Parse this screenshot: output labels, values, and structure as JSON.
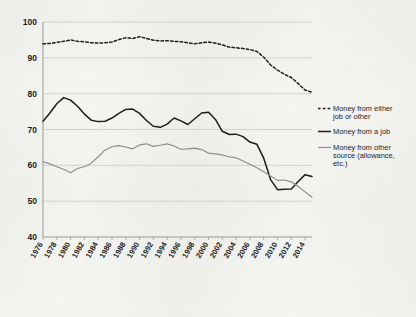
{
  "chart_data": {
    "type": "line",
    "title": "",
    "subtitle": "",
    "xlabel": "",
    "ylabel": "",
    "xlim": [
      1976,
      2015
    ],
    "ylim": [
      40,
      100
    ],
    "yticks": [
      40,
      50,
      60,
      70,
      80,
      90,
      100
    ],
    "xticks": [
      1976,
      1978,
      1980,
      1982,
      1984,
      1986,
      1988,
      1990,
      1992,
      1994,
      1996,
      1998,
      2000,
      2002,
      2004,
      2006,
      2008,
      2010,
      2012,
      2014
    ],
    "grid": true,
    "legend_position": "right",
    "x": [
      1976,
      1977,
      1978,
      1979,
      1980,
      1981,
      1982,
      1983,
      1984,
      1985,
      1986,
      1987,
      1988,
      1989,
      1990,
      1991,
      1992,
      1993,
      1994,
      1995,
      1996,
      1997,
      1998,
      1999,
      2000,
      2001,
      2002,
      2003,
      2004,
      2005,
      2006,
      2007,
      2008,
      2009,
      2010,
      2011,
      2012,
      2013,
      2014,
      2015
    ],
    "series": [
      {
        "name": "Money from either job or other",
        "style": "dashed",
        "color": "#1a1a1a",
        "values": [
          93.9,
          94.0,
          94.3,
          94.6,
          95.0,
          94.6,
          94.5,
          94.2,
          94.1,
          94.2,
          94.4,
          95.1,
          95.6,
          95.4,
          95.9,
          95.4,
          94.9,
          94.7,
          94.8,
          94.6,
          94.5,
          94.2,
          93.9,
          94.2,
          94.4,
          94.1,
          93.6,
          93.0,
          92.8,
          92.6,
          92.3,
          91.8,
          90.2,
          88.0,
          86.6,
          85.4,
          84.5,
          82.8,
          81.0,
          80.4
        ]
      },
      {
        "name": "Money from a job",
        "style": "solid",
        "color": "#1a1a1a",
        "values": [
          72.3,
          74.6,
          77.2,
          78.9,
          78.2,
          76.5,
          74.3,
          72.6,
          72.2,
          72.3,
          73.2,
          74.5,
          75.6,
          75.7,
          74.5,
          72.5,
          70.9,
          70.6,
          71.5,
          73.2,
          72.4,
          71.4,
          73.0,
          74.6,
          74.8,
          72.8,
          69.5,
          68.6,
          68.7,
          68.0,
          66.5,
          65.9,
          62.0,
          56.0,
          53.2,
          53.3,
          53.4,
          55.5,
          57.4,
          56.9
        ]
      },
      {
        "name": "Money from other source (allowance, etc.)",
        "style": "solid",
        "color": "#8c8c8c",
        "values": [
          61.0,
          60.4,
          59.6,
          58.9,
          57.9,
          59.1,
          59.6,
          60.6,
          62.4,
          64.3,
          65.2,
          65.5,
          65.1,
          64.6,
          65.7,
          66.0,
          65.3,
          65.6,
          66.0,
          65.4,
          64.5,
          64.6,
          64.8,
          64.4,
          63.4,
          63.2,
          62.9,
          62.4,
          62.1,
          61.2,
          60.3,
          59.3,
          58.2,
          57.0,
          55.8,
          55.9,
          55.4,
          54.1,
          52.6,
          51.1
        ]
      }
    ]
  },
  "legend": {
    "items": [
      {
        "label_line1": "Money from either",
        "label_line2": "job or other",
        "swatch": "dashed-line-swatch"
      },
      {
        "label_line1": "Money from a job",
        "label_line2": "",
        "swatch": "solid-black-line-swatch"
      },
      {
        "label_line1": "Money from other",
        "label_line2": "source (allowance,",
        "label_line3": "etc.)",
        "swatch": "solid-gray-line-swatch"
      }
    ]
  },
  "colors": {
    "background": "#f6f6f3",
    "grid": "#c9c9c6",
    "axis": "#9a9a97",
    "series_dark": "#1a1a1a",
    "series_gray": "#8c8c8c",
    "text": "#1b1b1b"
  }
}
